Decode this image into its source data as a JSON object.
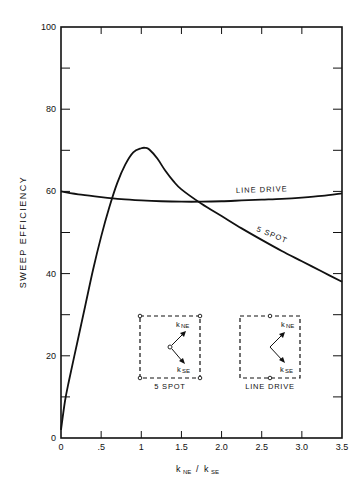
{
  "chart_data": {
    "type": "line",
    "title": "",
    "xlabel": "kNE / kSE",
    "ylabel": "SWEEP EFFICIENCY",
    "xlim": [
      0,
      3.5
    ],
    "ylim": [
      0,
      100
    ],
    "grid": false,
    "x_ticks": [
      0,
      0.5,
      1,
      1.5,
      2.0,
      2.5,
      3.0,
      3.5
    ],
    "x_tick_labels": [
      "0",
      ".5",
      "1",
      "1.5",
      "2.0",
      "2.5",
      "3.0",
      "3.5"
    ],
    "y_ticks_major": [
      0,
      20,
      40,
      60,
      80,
      100
    ],
    "y_tick_labels": [
      "0",
      "20",
      "40",
      "60",
      "80",
      "100"
    ],
    "y_ticks_minor": [
      10,
      30,
      50,
      70,
      90
    ],
    "series": [
      {
        "name": "5 SPOT",
        "x": [
          0,
          0.05,
          0.1,
          0.2,
          0.3,
          0.4,
          0.5,
          0.6,
          0.7,
          0.8,
          0.9,
          1.0,
          1.05,
          1.1,
          1.2,
          1.3,
          1.4,
          1.5,
          1.75,
          2.0,
          2.25,
          2.5,
          2.75,
          3.0,
          3.25,
          3.5
        ],
        "y": [
          2,
          9,
          14,
          23,
          32,
          41,
          49,
          56,
          62,
          66.5,
          69.5,
          70.5,
          70.6,
          70.2,
          68,
          65,
          62.5,
          60.5,
          57,
          54,
          51,
          48.2,
          45.5,
          43,
          40.5,
          38
        ]
      },
      {
        "name": "LINE DRIVE",
        "x": [
          0,
          0.25,
          0.5,
          0.75,
          1.0,
          1.25,
          1.5,
          1.75,
          2.0,
          2.25,
          2.5,
          2.75,
          3.0,
          3.25,
          3.5
        ],
        "y": [
          60,
          59.2,
          58.6,
          58.1,
          57.8,
          57.6,
          57.5,
          57.5,
          57.6,
          57.8,
          58,
          58.2,
          58.5,
          58.9,
          59.5
        ]
      }
    ],
    "annotations": [
      "LINE DRIVE",
      "5 SPOT"
    ],
    "insets": [
      {
        "label": "5 SPOT",
        "arrows": [
          "kNE",
          "kSE"
        ]
      },
      {
        "label": "LINE DRIVE",
        "arrows": [
          "kNE",
          "kSE"
        ]
      }
    ]
  },
  "labels": {
    "ylabel": "SWEEP EFFICIENCY",
    "xlabel_main_1": "k",
    "xlabel_sub_1": "NE",
    "xlabel_slash": "/",
    "xlabel_main_2": "k",
    "xlabel_sub_2": "SE",
    "curve_line_drive": "LINE DRIVE",
    "curve_5spot": "5 SPOT",
    "inset_5spot": "5 SPOT",
    "inset_line_drive": "LINE DRIVE",
    "k": "k",
    "ne": "NE",
    "se": "SE"
  }
}
